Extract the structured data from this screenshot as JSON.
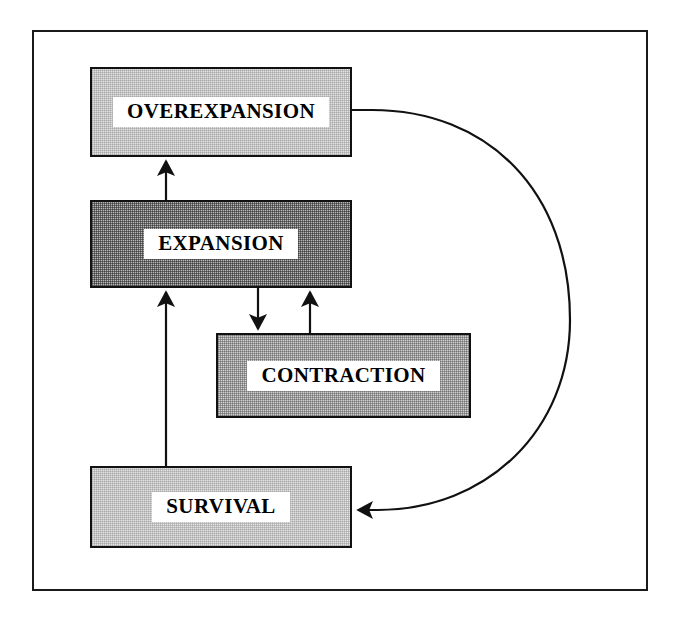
{
  "diagram": {
    "frame": {
      "name": "outer-border"
    },
    "palette": {
      "stroke": "#111111",
      "fill_light": "#e2e2e2",
      "fill_medium": "#d2d2d2",
      "fill_dark": "#b7b7b7",
      "label_band": "#ffffff",
      "text": "#000000"
    },
    "nodes": [
      {
        "id": "overexpansion",
        "label": "OVEREXPANSION",
        "shade": "light",
        "x": 90,
        "y": 67,
        "width": 262,
        "height": 90
      },
      {
        "id": "expansion",
        "label": "EXPANSION",
        "shade": "dark",
        "x": 90,
        "y": 200,
        "width": 262,
        "height": 88
      },
      {
        "id": "contraction",
        "label": "CONTRACTION",
        "shade": "medium",
        "x": 216,
        "y": 333,
        "width": 255,
        "height": 85
      },
      {
        "id": "survival",
        "label": "SURVIVAL",
        "shade": "light",
        "x": 90,
        "y": 466,
        "width": 262,
        "height": 82
      }
    ],
    "edges": [
      {
        "id": "expansion-to-overexpansion",
        "from": "expansion",
        "to": "overexpansion",
        "style": "straight-arrow",
        "direction": "up"
      },
      {
        "id": "expansion-to-contraction",
        "from": "expansion",
        "to": "contraction",
        "style": "straight-arrow",
        "direction": "down"
      },
      {
        "id": "contraction-to-expansion",
        "from": "contraction",
        "to": "expansion",
        "style": "straight-arrow",
        "direction": "up"
      },
      {
        "id": "survival-to-expansion",
        "from": "survival",
        "to": "expansion",
        "style": "straight-arrow",
        "direction": "up"
      },
      {
        "id": "overexpansion-to-survival",
        "from": "overexpansion",
        "to": "survival",
        "style": "curved-arrow",
        "direction": "clockwise-right"
      }
    ]
  }
}
